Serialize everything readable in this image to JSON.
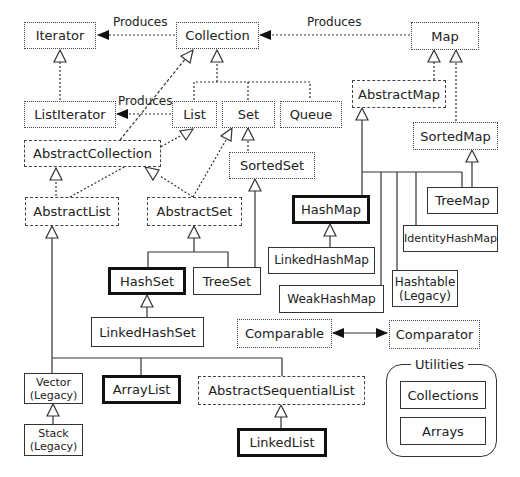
{
  "diagram": {
    "edge_label_produces": "Produces",
    "legend": {
      "interface_style": "dotted",
      "abstract_style": "dashed",
      "concrete_style": "solid",
      "highlighted_style": "bold"
    },
    "nodes": {
      "iterator": {
        "label": "Iterator",
        "kind": "interface"
      },
      "collection": {
        "label": "Collection",
        "kind": "interface"
      },
      "map": {
        "label": "Map",
        "kind": "interface"
      },
      "list_iterator": {
        "label": "ListIterator",
        "kind": "interface"
      },
      "list": {
        "label": "List",
        "kind": "interface"
      },
      "set": {
        "label": "Set",
        "kind": "interface"
      },
      "queue": {
        "label": "Queue",
        "kind": "interface"
      },
      "abstract_map": {
        "label": "AbstractMap",
        "kind": "abstract"
      },
      "abstract_collection": {
        "label": "AbstractCollection",
        "kind": "abstract"
      },
      "sorted_set": {
        "label": "SortedSet",
        "kind": "interface"
      },
      "sorted_map": {
        "label": "SortedMap",
        "kind": "interface"
      },
      "abstract_list": {
        "label": "AbstractList",
        "kind": "abstract"
      },
      "abstract_set": {
        "label": "AbstractSet",
        "kind": "abstract"
      },
      "hash_map": {
        "label": "HashMap",
        "kind": "highlighted"
      },
      "tree_map": {
        "label": "TreeMap",
        "kind": "concrete"
      },
      "identity_hash_map": {
        "label": "IdentityHashMap",
        "kind": "concrete"
      },
      "linked_hash_map": {
        "label": "LinkedHashMap",
        "kind": "concrete"
      },
      "hash_set": {
        "label": "HashSet",
        "kind": "highlighted"
      },
      "tree_set": {
        "label": "TreeSet",
        "kind": "concrete"
      },
      "hashtable": {
        "label": "Hashtable",
        "sublabel": "(Legacy)",
        "kind": "concrete"
      },
      "weak_hash_map": {
        "label": "WeakHashMap",
        "kind": "concrete"
      },
      "linked_hash_set": {
        "label": "LinkedHashSet",
        "kind": "concrete"
      },
      "comparable": {
        "label": "Comparable",
        "kind": "interface"
      },
      "comparator": {
        "label": "Comparator",
        "kind": "interface"
      },
      "vector": {
        "label": "Vector",
        "sublabel": "(Legacy)",
        "kind": "concrete"
      },
      "array_list": {
        "label": "ArrayList",
        "kind": "highlighted"
      },
      "abstract_sequential_list": {
        "label": "AbstractSequentialList",
        "kind": "abstract"
      },
      "stack": {
        "label": "Stack",
        "sublabel": "(Legacy)",
        "kind": "concrete"
      },
      "linked_list": {
        "label": "LinkedList",
        "kind": "highlighted"
      }
    },
    "utilities": {
      "title": "Utilities",
      "items": [
        "Collections",
        "Arrays"
      ]
    },
    "edges": [
      {
        "from": "Collection",
        "to": "Iterator",
        "type": "produces",
        "label": "Produces"
      },
      {
        "from": "Map",
        "to": "Collection",
        "type": "produces",
        "label": "Produces"
      },
      {
        "from": "List",
        "to": "ListIterator",
        "type": "produces",
        "label": "Produces"
      },
      {
        "from": "ListIterator",
        "to": "Iterator",
        "type": "extends"
      },
      {
        "from": "List",
        "to": "Collection",
        "type": "extends"
      },
      {
        "from": "Set",
        "to": "Collection",
        "type": "extends"
      },
      {
        "from": "Queue",
        "to": "Collection",
        "type": "extends"
      },
      {
        "from": "AbstractCollection",
        "to": "Collection",
        "type": "implements"
      },
      {
        "from": "SortedSet",
        "to": "Set",
        "type": "extends"
      },
      {
        "from": "AbstractList",
        "to": "AbstractCollection",
        "type": "extends"
      },
      {
        "from": "AbstractList",
        "to": "List",
        "type": "implements"
      },
      {
        "from": "AbstractSet",
        "to": "AbstractCollection",
        "type": "extends"
      },
      {
        "from": "AbstractSet",
        "to": "Set",
        "type": "implements"
      },
      {
        "from": "AbstractMap",
        "to": "Map",
        "type": "implements"
      },
      {
        "from": "SortedMap",
        "to": "Map",
        "type": "extends"
      },
      {
        "from": "HashSet",
        "to": "AbstractSet",
        "type": "extends"
      },
      {
        "from": "TreeSet",
        "to": "AbstractSet",
        "type": "extends"
      },
      {
        "from": "TreeSet",
        "to": "SortedSet",
        "type": "implements"
      },
      {
        "from": "LinkedHashSet",
        "to": "HashSet",
        "type": "extends"
      },
      {
        "from": "HashMap",
        "to": "AbstractMap",
        "type": "extends"
      },
      {
        "from": "WeakHashMap",
        "to": "AbstractMap",
        "type": "extends"
      },
      {
        "from": "Hashtable",
        "to": "AbstractMap",
        "type": "extends"
      },
      {
        "from": "IdentityHashMap",
        "to": "AbstractMap",
        "type": "extends"
      },
      {
        "from": "TreeMap",
        "to": "AbstractMap",
        "type": "extends"
      },
      {
        "from": "TreeMap",
        "to": "SortedMap",
        "type": "implements"
      },
      {
        "from": "LinkedHashMap",
        "to": "HashMap",
        "type": "extends"
      },
      {
        "from": "Vector",
        "to": "AbstractList",
        "type": "extends"
      },
      {
        "from": "ArrayList",
        "to": "AbstractList",
        "type": "extends"
      },
      {
        "from": "AbstractSequentialList",
        "to": "AbstractList",
        "type": "extends"
      },
      {
        "from": "Stack",
        "to": "Vector",
        "type": "extends"
      },
      {
        "from": "LinkedList",
        "to": "AbstractSequentialList",
        "type": "extends"
      },
      {
        "from": "Comparable",
        "to": "Comparator",
        "type": "association"
      }
    ]
  }
}
